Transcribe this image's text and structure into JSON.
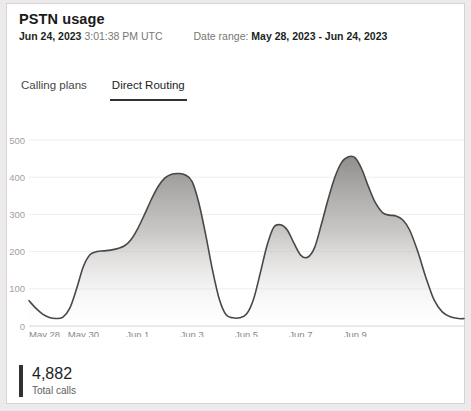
{
  "header": {
    "title": "PSTN usage",
    "generated_date": "Jun 24, 2023",
    "generated_time": "3:01:38 PM UTC",
    "date_range_label": "Date range:",
    "date_range_value": "May 28, 2023 - Jun 24, 2023"
  },
  "tabs": [
    {
      "label": "Calling plans",
      "active": false
    },
    {
      "label": "Direct Routing",
      "active": true
    }
  ],
  "footer": {
    "value": "4,882",
    "label": "Total calls",
    "accent": "#323130"
  },
  "colors": {
    "card_bg": "#ffffff",
    "page_bg": "#eceaea",
    "border": "#d6d4d2",
    "line": "#4a4846",
    "area_top": "#8a8886",
    "area_bottom": "#fafafa",
    "gridline": "#f0eeed",
    "axis_text": "#a19f9d"
  },
  "chart_data": {
    "type": "area",
    "title": "PSTN usage",
    "xlabel": "",
    "ylabel": "",
    "ylim": [
      0,
      500
    ],
    "yticks": [
      0,
      100,
      200,
      300,
      400,
      500
    ],
    "grid": true,
    "legend": null,
    "xticks": [
      "May 28",
      "May 30",
      "Jun 1",
      "Jun 3",
      "Jun 5",
      "Jun 7",
      "Jun 9"
    ],
    "xtick_positions": [
      0,
      2,
      4,
      6,
      8,
      10,
      12
    ],
    "xlim": [
      0,
      14
    ],
    "x": [
      0,
      0.25,
      0.5,
      0.75,
      1.0,
      1.25,
      1.5,
      1.75,
      2.0,
      2.25,
      2.5,
      2.75,
      3.0,
      3.25,
      3.5,
      3.75,
      4.0,
      4.25,
      4.5,
      4.75,
      5.0,
      5.25,
      5.5,
      5.75,
      6.0,
      6.25,
      6.5,
      6.75,
      7.0,
      7.25,
      7.5,
      7.75,
      8.0,
      8.25,
      8.5,
      8.75,
      9.0,
      9.25,
      9.5,
      9.75,
      10.0,
      10.25,
      10.5,
      10.75,
      11.0,
      11.25,
      11.5,
      11.75,
      12.0,
      12.25,
      12.5,
      12.75,
      13.0,
      13.25,
      13.5,
      13.75,
      14.0
    ],
    "values": [
      68,
      48,
      32,
      23,
      20,
      24,
      48,
      100,
      160,
      192,
      200,
      202,
      204,
      208,
      215,
      232,
      262,
      300,
      340,
      375,
      398,
      408,
      410,
      406,
      388,
      330,
      245,
      150,
      72,
      30,
      22,
      22,
      32,
      70,
      140,
      215,
      265,
      272,
      258,
      222,
      190,
      185,
      210,
      272,
      340,
      400,
      440,
      455,
      452,
      420,
      372,
      330,
      305,
      298,
      296,
      285,
      258
    ],
    "series": [
      {
        "name": "Total calls",
        "values": [
          68,
          48,
          32,
          23,
          20,
          24,
          48,
          100,
          160,
          192,
          200,
          202,
          204,
          208,
          215,
          232,
          262,
          300,
          340,
          375,
          398,
          408,
          410,
          406,
          388,
          330,
          245,
          150,
          72,
          30,
          22,
          22,
          32,
          70,
          140,
          215,
          265,
          272,
          258,
          222,
          190,
          185,
          210,
          272,
          340,
          400,
          440,
          455,
          452,
          420,
          372,
          330,
          305,
          298,
          296,
          285,
          258
        ]
      }
    ],
    "tail_x": [
      14.0,
      14.3,
      14.6,
      14.9,
      15.2,
      15.5,
      15.8,
      16.0
    ],
    "tail_values": [
      258,
      200,
      130,
      70,
      38,
      25,
      20,
      20
    ]
  }
}
